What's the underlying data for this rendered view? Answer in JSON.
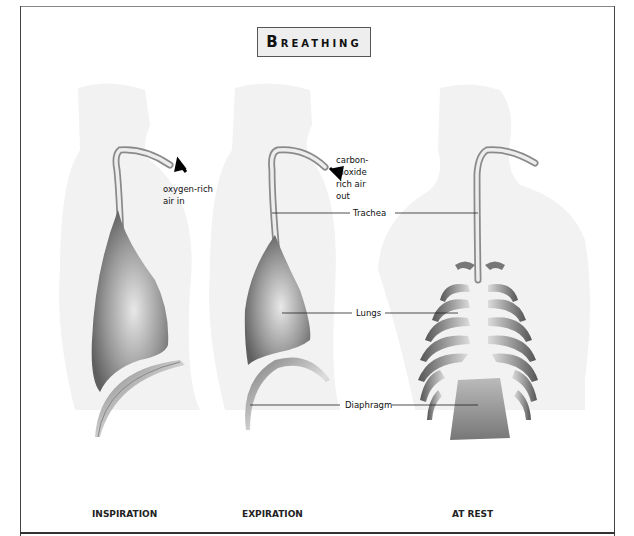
{
  "title": {
    "first_letter": "B",
    "rest": "REATHING",
    "full": "Breathing"
  },
  "annotations": {
    "inspiration_air": [
      "oxygen-rich",
      "air in"
    ],
    "expiration_air": [
      "carbon-",
      "dioxide",
      "rich air",
      "out"
    ]
  },
  "labels": {
    "trachea": "Trachea",
    "lungs": "Lungs",
    "diaphragm": "Diaphragm"
  },
  "stages": [
    {
      "label": "INSPIRATION"
    },
    {
      "label": "EXPIRATION"
    },
    {
      "label": "AT REST"
    }
  ],
  "colors": {
    "silhouette": "#f1f1f1",
    "organ_dark": "#6e6e6e",
    "organ_light": "#e6e6e6",
    "text": "#111111",
    "frame": "#444444"
  },
  "icons": {
    "air_in_arrow": "arrow-up-left",
    "air_out_arrow": "arrow-down-right"
  }
}
